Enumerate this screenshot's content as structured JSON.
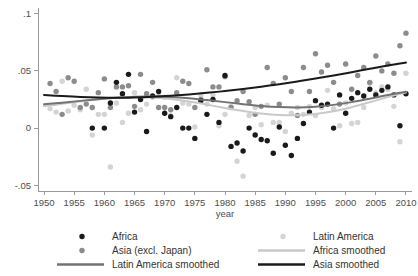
{
  "chart_data": {
    "type": "scatter",
    "title": "",
    "xlabel": "year",
    "ylabel": "",
    "xlim": [
      1949,
      2011
    ],
    "ylim": [
      -0.055,
      0.105
    ],
    "grid": false,
    "legend_position": "below",
    "xticks": [
      1950,
      1955,
      1960,
      1965,
      1970,
      1975,
      1980,
      1985,
      1990,
      1995,
      2000,
      2005,
      2010
    ],
    "xticklabels": [
      "1950",
      "1955",
      "1960",
      "1965",
      "1970",
      "1975",
      "1980",
      "1985",
      "1990",
      "1995",
      "2000",
      "2005",
      "2010"
    ],
    "yticks": [
      -0.05,
      0,
      0.05,
      0.1
    ],
    "yticklabels": [
      "-.05",
      "0",
      ".05",
      ".1"
    ],
    "colors": {
      "africa_points": "#1a1a1a",
      "asia_points": "#8c8c8c",
      "latin_america_points": "#d4d4d4",
      "asia_smoothed": "#1a1a1a",
      "latin_america_smoothed": "#737373",
      "africa_smoothed": "#c9c9c9"
    },
    "series": [
      {
        "name": "Africa",
        "kind": "scatter",
        "marker": "circle",
        "color": "#1a1a1a",
        "x": [
          1958,
          1960,
          1961,
          1962,
          1963,
          1964,
          1965,
          1966,
          1967,
          1968,
          1969,
          1970,
          1971,
          1972,
          1973,
          1974,
          1975,
          1976,
          1977,
          1978,
          1979,
          1980,
          1981,
          1982,
          1983,
          1984,
          1985,
          1986,
          1987,
          1988,
          1989,
          1990,
          1991,
          1992,
          1993,
          1994,
          1995,
          1996,
          1997,
          1998,
          1999,
          2000,
          2001,
          2002,
          2003,
          2004,
          2005,
          2006,
          2007,
          2008,
          2009,
          2010
        ],
        "y": [
          0.0,
          0.0,
          0.022,
          0.04,
          0.03,
          0.047,
          0.014,
          0.025,
          -0.003,
          0.028,
          0.032,
          0.013,
          0.01,
          0.018,
          0.0,
          0.0,
          -0.009,
          0.024,
          0.012,
          0.025,
          0.005,
          0.046,
          -0.016,
          -0.013,
          -0.02,
          0.0,
          -0.006,
          -0.01,
          -0.011,
          -0.022,
          0.001,
          -0.015,
          -0.024,
          -0.009,
          0.004,
          0.014,
          0.024,
          0.02,
          0.021,
          0.0,
          0.029,
          0.013,
          0.026,
          0.031,
          0.028,
          0.034,
          0.029,
          0.033,
          0.036,
          0.029,
          0.002,
          0.03
        ]
      },
      {
        "name": "Asia (excl. Japan)",
        "kind": "scatter",
        "marker": "circle",
        "color": "#8c8c8c",
        "x": [
          1951,
          1952,
          1953,
          1954,
          1955,
          1956,
          1957,
          1958,
          1959,
          1960,
          1961,
          1962,
          1963,
          1964,
          1965,
          1966,
          1967,
          1968,
          1969,
          1970,
          1971,
          1972,
          1973,
          1974,
          1975,
          1976,
          1977,
          1978,
          1979,
          1980,
          1981,
          1982,
          1983,
          1984,
          1985,
          1986,
          1987,
          1988,
          1989,
          1990,
          1991,
          1992,
          1993,
          1994,
          1995,
          1996,
          1997,
          1998,
          1999,
          2000,
          2001,
          2002,
          2003,
          2004,
          2005,
          2006,
          2007,
          2008,
          2009,
          2010
        ],
        "y": [
          0.039,
          0.032,
          0.012,
          0.044,
          0.041,
          0.018,
          0.021,
          0.018,
          0.031,
          0.043,
          0.018,
          0.036,
          0.036,
          0.037,
          0.019,
          0.047,
          0.03,
          0.04,
          0.018,
          0.018,
          0.016,
          0.031,
          0.041,
          0.039,
          0.018,
          0.025,
          0.051,
          0.036,
          0.036,
          0.045,
          0.018,
          0.024,
          0.032,
          0.023,
          0.012,
          0.019,
          0.053,
          0.039,
          0.021,
          0.044,
          0.032,
          0.011,
          0.053,
          0.032,
          0.065,
          0.049,
          0.055,
          0.04,
          0.021,
          0.056,
          0.034,
          0.046,
          0.053,
          0.04,
          0.063,
          0.05,
          0.056,
          0.048,
          0.072,
          0.083
        ]
      },
      {
        "name": "Latin America",
        "kind": "scatter",
        "marker": "circle",
        "color": "#d4d4d4",
        "x": [
          1951,
          1952,
          1953,
          1954,
          1955,
          1956,
          1957,
          1958,
          1959,
          1960,
          1961,
          1962,
          1963,
          1964,
          1965,
          1966,
          1967,
          1968,
          1969,
          1970,
          1971,
          1972,
          1973,
          1974,
          1975,
          1976,
          1977,
          1978,
          1979,
          1980,
          1981,
          1982,
          1983,
          1984,
          1985,
          1986,
          1987,
          1988,
          1989,
          1990,
          1991,
          1992,
          1993,
          1994,
          1995,
          1996,
          1997,
          1998,
          1999,
          2000,
          2001,
          2002,
          2003,
          2004,
          2005,
          2006,
          2007,
          2008,
          2009,
          2010
        ],
        "y": [
          0.017,
          0.014,
          0.041,
          0.015,
          0.02,
          0.016,
          0.034,
          -0.006,
          0.012,
          0.012,
          -0.034,
          0.022,
          0.005,
          0.013,
          0.031,
          0.016,
          0.021,
          0.027,
          0.028,
          0.027,
          0.011,
          0.044,
          0.022,
          0.021,
          0.001,
          0.029,
          0.021,
          0.029,
          0.002,
          0.012,
          0.019,
          -0.029,
          -0.042,
          0.011,
          0.018,
          0.003,
          0.02,
          0.005,
          0.005,
          -0.003,
          0.013,
          0.018,
          0.012,
          0.019,
          0.011,
          0.018,
          0.033,
          0.017,
          0.002,
          0.022,
          0.004,
          0.005,
          0.018,
          0.039,
          0.031,
          0.036,
          0.034,
          0.019,
          -0.012,
          0.048
        ]
      },
      {
        "name": "Asia smoothed",
        "kind": "line",
        "color": "#1a1a1a",
        "x": [
          1950,
          1953,
          1956,
          1959,
          1962,
          1965,
          1968,
          1971,
          1974,
          1977,
          1980,
          1983,
          1986,
          1989,
          1992,
          1995,
          1998,
          2001,
          2004,
          2007,
          2010
        ],
        "y": [
          0.029,
          0.028,
          0.0272,
          0.0267,
          0.0265,
          0.0268,
          0.0274,
          0.0283,
          0.0294,
          0.0308,
          0.0324,
          0.0342,
          0.0362,
          0.0384,
          0.0408,
          0.0433,
          0.046,
          0.0489,
          0.0519,
          0.0548,
          0.0573
        ]
      },
      {
        "name": "Latin America smoothed",
        "kind": "line",
        "color": "#737373",
        "x": [
          1950,
          1953,
          1956,
          1959,
          1962,
          1965,
          1968,
          1971,
          1974,
          1977,
          1980,
          1983,
          1986,
          1989,
          1992,
          1995,
          1998,
          2001,
          2004,
          2007,
          2010
        ],
        "y": [
          0.0208,
          0.0222,
          0.0238,
          0.0253,
          0.0266,
          0.0275,
          0.0277,
          0.0272,
          0.0261,
          0.0245,
          0.0227,
          0.0209,
          0.0194,
          0.0184,
          0.0181,
          0.0187,
          0.0203,
          0.0227,
          0.0257,
          0.0289,
          0.0318
        ]
      },
      {
        "name": "Africa smoothed",
        "kind": "line",
        "color": "#c9c9c9",
        "x": [
          1950,
          1953,
          1956,
          1959,
          1962,
          1965,
          1968,
          1971,
          1974,
          1977,
          1980,
          1983,
          1986,
          1989,
          1992,
          1995,
          1998,
          2001,
          2004,
          2007,
          2010
        ],
        "y": [
          0.0192,
          0.0212,
          0.0233,
          0.0252,
          0.0266,
          0.0272,
          0.0268,
          0.0254,
          0.0232,
          0.0205,
          0.0176,
          0.0149,
          0.0128,
          0.0115,
          0.0113,
          0.0124,
          0.0148,
          0.0183,
          0.0226,
          0.0272,
          0.0312
        ]
      }
    ],
    "legend": [
      {
        "label": "Africa",
        "type": "marker",
        "color": "#1a1a1a",
        "column": "left",
        "row": 0
      },
      {
        "label": "Asia (excl. Japan)",
        "type": "marker",
        "color": "#8c8c8c",
        "column": "left",
        "row": 1
      },
      {
        "label": "Latin America smoothed",
        "type": "line",
        "color": "#737373",
        "column": "left",
        "row": 2
      },
      {
        "label": "Latin America",
        "type": "marker",
        "color": "#d4d4d4",
        "column": "right",
        "row": 0
      },
      {
        "label": "Africa smoothed",
        "type": "line",
        "color": "#c9c9c9",
        "column": "right",
        "row": 1
      },
      {
        "label": "Asia smoothed",
        "type": "line",
        "color": "#1a1a1a",
        "column": "right",
        "row": 2
      }
    ]
  }
}
